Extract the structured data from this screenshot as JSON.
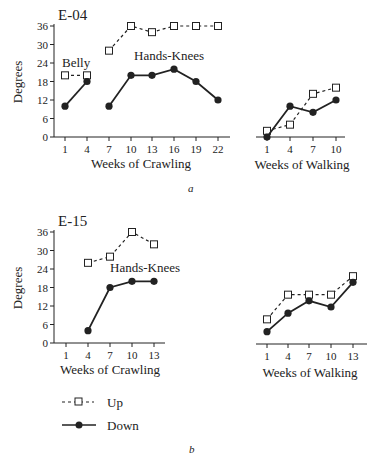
{
  "figure": {
    "caption_a": "a",
    "caption_b": "b",
    "legend": {
      "up_label": "Up",
      "down_label": "Down"
    }
  },
  "colors": {
    "ink": "#222222",
    "background": "#ffffff"
  },
  "chart_data": [
    {
      "type": "line",
      "panel": "a",
      "title": "E-04",
      "subplot": "crawling",
      "xlabel": "Weeks of Crawling",
      "ylabel": "Degrees",
      "ylim": [
        0,
        36
      ],
      "yticks": [
        0,
        6,
        12,
        18,
        24,
        30,
        36
      ],
      "xticks": [
        1,
        4,
        7,
        10,
        13,
        16,
        19,
        22
      ],
      "grid": false,
      "annotations": [
        {
          "text": "Belly",
          "x": 1,
          "y": 22
        },
        {
          "text": "Hands-Knees",
          "x": 10,
          "y": 30
        }
      ],
      "series": [
        {
          "name": "Up",
          "segment": "Belly",
          "style": "dashed-open-square",
          "x": [
            1,
            4
          ],
          "values": [
            20,
            20
          ]
        },
        {
          "name": "Down",
          "segment": "Belly",
          "style": "solid-filled-circle",
          "x": [
            1,
            4
          ],
          "values": [
            10,
            18
          ]
        },
        {
          "name": "Up",
          "segment": "Hands-Knees",
          "style": "dashed-open-square",
          "x": [
            7,
            10,
            13,
            16,
            19,
            22
          ],
          "values": [
            28,
            36,
            34,
            36,
            36,
            36
          ]
        },
        {
          "name": "Down",
          "segment": "Hands-Knees",
          "style": "solid-filled-circle",
          "x": [
            7,
            10,
            13,
            16,
            19,
            22
          ],
          "values": [
            10,
            20,
            20,
            22,
            18,
            12
          ]
        }
      ]
    },
    {
      "type": "line",
      "panel": "a",
      "title": "E-04",
      "subplot": "walking",
      "xlabel": "Weeks of Walking",
      "ylabel": "Degrees",
      "ylim": [
        0,
        36
      ],
      "xticks": [
        1,
        4,
        7,
        10
      ],
      "grid": false,
      "series": [
        {
          "name": "Up",
          "style": "dashed-open-square",
          "x": [
            1,
            4,
            7,
            10
          ],
          "values": [
            2,
            4,
            14,
            16
          ]
        },
        {
          "name": "Down",
          "style": "solid-filled-circle",
          "x": [
            1,
            4,
            7,
            10
          ],
          "values": [
            0,
            10,
            8,
            12
          ]
        }
      ]
    },
    {
      "type": "line",
      "panel": "b",
      "title": "E-15",
      "subplot": "crawling",
      "xlabel": "Weeks of Crawling",
      "ylabel": "Degrees",
      "ylim": [
        0,
        36
      ],
      "yticks": [
        0,
        6,
        12,
        18,
        24,
        30,
        36
      ],
      "xticks": [
        1,
        4,
        7,
        10,
        13
      ],
      "grid": false,
      "annotations": [
        {
          "text": "Hands-Knees",
          "x": 9,
          "y": 24
        }
      ],
      "series": [
        {
          "name": "Up",
          "segment": "Hands-Knees",
          "style": "dashed-open-square",
          "x": [
            4,
            7,
            10,
            13
          ],
          "values": [
            26,
            28,
            36,
            32
          ]
        },
        {
          "name": "Down",
          "segment": "Hands-Knees",
          "style": "solid-filled-circle",
          "x": [
            4,
            7,
            10,
            13
          ],
          "values": [
            4,
            18,
            20,
            20
          ]
        }
      ]
    },
    {
      "type": "line",
      "panel": "b",
      "title": "E-15",
      "subplot": "walking",
      "xlabel": "Weeks of Walking",
      "ylabel": "Degrees",
      "ylim": [
        0,
        36
      ],
      "xticks": [
        1,
        4,
        7,
        10,
        13
      ],
      "grid": false,
      "series": [
        {
          "name": "Up",
          "style": "dashed-open-square",
          "x": [
            1,
            4,
            7,
            10,
            13
          ],
          "values": [
            8,
            16,
            16,
            16,
            22
          ]
        },
        {
          "name": "Down",
          "style": "solid-filled-circle",
          "x": [
            1,
            4,
            7,
            10,
            13
          ],
          "values": [
            4,
            10,
            14,
            12,
            20
          ]
        }
      ]
    }
  ]
}
